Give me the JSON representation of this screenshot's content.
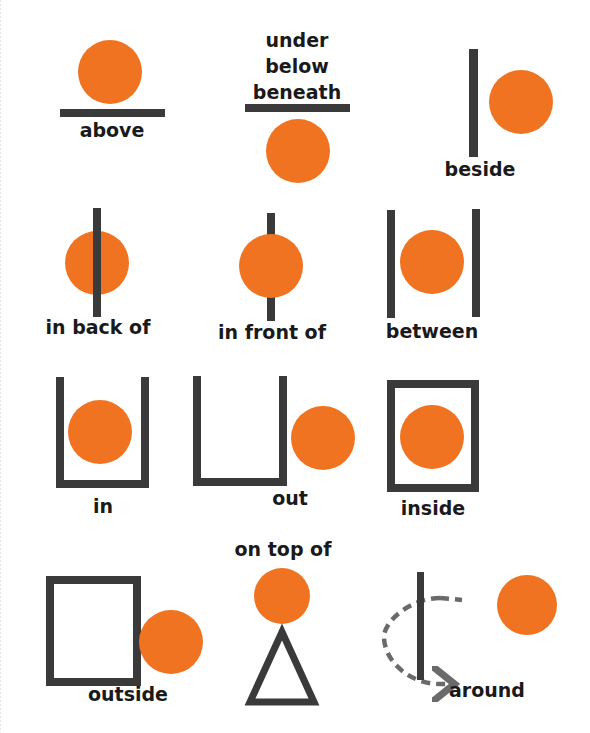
{
  "colors": {
    "ball": "#f07321",
    "bar": "#3a3a3a",
    "text": "#1a1a1a",
    "dashed": "#6a6a6a",
    "background": "#ffffff"
  },
  "cells": [
    {
      "id": "above",
      "labels": [
        "above"
      ]
    },
    {
      "id": "under",
      "labels": [
        "under",
        "below",
        "beneath"
      ]
    },
    {
      "id": "beside",
      "labels": [
        "beside"
      ]
    },
    {
      "id": "in-back-of",
      "labels": [
        "in back of"
      ]
    },
    {
      "id": "in-front-of",
      "labels": [
        "in front of"
      ]
    },
    {
      "id": "between",
      "labels": [
        "between"
      ]
    },
    {
      "id": "in",
      "labels": [
        "in"
      ]
    },
    {
      "id": "out",
      "labels": [
        "out"
      ]
    },
    {
      "id": "inside",
      "labels": [
        "inside"
      ]
    },
    {
      "id": "outside",
      "labels": [
        "outside"
      ]
    },
    {
      "id": "on-top-of",
      "labels": [
        "on top of"
      ]
    },
    {
      "id": "around",
      "labels": [
        "around"
      ]
    }
  ],
  "text": {
    "above": "above",
    "under": "under",
    "below": "below",
    "beneath": "beneath",
    "beside": "beside",
    "in_back_of": "in back of",
    "in_front_of": "in front of",
    "between": "between",
    "in": "in",
    "out": "out",
    "inside": "inside",
    "outside": "outside",
    "on_top_of": "on top of",
    "around": "around"
  }
}
